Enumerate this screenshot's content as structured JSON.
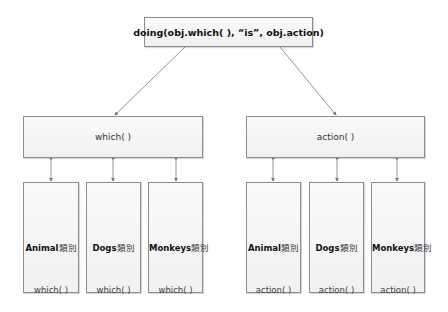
{
  "diagram": {
    "top": {
      "label": "doing(obj.which( ), “is”, obj.action)"
    },
    "groups": [
      {
        "parent": {
          "label": "which( )"
        },
        "children": [
          {
            "class_name": "Animal",
            "class_suffix": "類別",
            "method": "which( )"
          },
          {
            "class_name": "Dogs",
            "class_suffix": "類別",
            "method": "which( )"
          },
          {
            "class_name": "Monkeys",
            "class_suffix": "類別",
            "method": "which( )"
          }
        ]
      },
      {
        "parent": {
          "label": "action( )"
        },
        "children": [
          {
            "class_name": "Animal",
            "class_suffix": "類別",
            "method": "action( )"
          },
          {
            "class_name": "Dogs",
            "class_suffix": "類別",
            "method": "action( )"
          },
          {
            "class_name": "Monkeys",
            "class_suffix": "類別",
            "method": "action( )"
          }
        ]
      }
    ],
    "colors": {
      "border": "#8c8c8c",
      "arrow": "#7a7a7a",
      "fill": "#f4f4f4"
    }
  }
}
